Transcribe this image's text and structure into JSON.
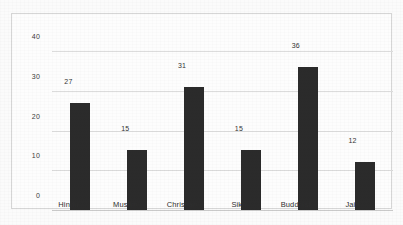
{
  "chart_data": {
    "type": "bar",
    "title": "",
    "subtitle": "",
    "xlabel": "",
    "ylabel": "",
    "categories": [
      "Hindu",
      "Muslim",
      "Christian",
      "Sikh",
      "Buddhist",
      "Jain"
    ],
    "values": [
      27,
      15,
      31,
      15,
      36,
      12
    ],
    "value_labels": [
      "27",
      "15",
      "31",
      "15",
      "36",
      "12"
    ],
    "ylim": [
      0,
      40
    ],
    "ytick_labels": [
      "0",
      "10",
      "20",
      "30",
      "40"
    ],
    "ytick_values": [
      0,
      10,
      20,
      30,
      40
    ],
    "grid": true,
    "grid_axis": "y",
    "legend": false,
    "legend_position": "none",
    "bar_color": "#2b2b2b",
    "gridline_color": "#dcdcdc",
    "frame_color": "#d6d6d6",
    "background_color": "#fdfdfd"
  }
}
